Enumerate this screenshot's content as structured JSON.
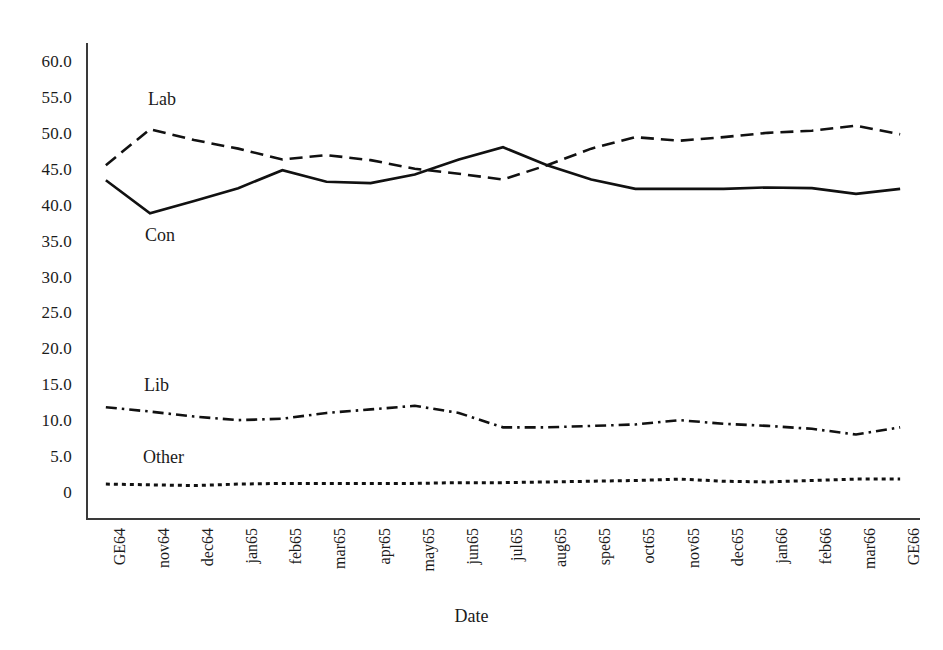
{
  "chart_data": {
    "type": "line",
    "title": "",
    "xlabel": "Date",
    "ylabel": "",
    "ylim": [
      0,
      60
    ],
    "grid": false,
    "legend_position": "in-plot labels",
    "categories": [
      "GE64",
      "nov64",
      "dec64",
      "jan65",
      "feb65",
      "mar65",
      "apr65",
      "may65",
      "jun65",
      "jul65",
      "aug65",
      "spe65",
      "oct65",
      "nov65",
      "dec65",
      "jan66",
      "feb66",
      "mar66",
      "GE66"
    ],
    "y_ticks": [
      "0",
      "5.0",
      "10.0",
      "15.0",
      "20.0",
      "25.0",
      "30.0",
      "35.0",
      "40.0",
      "45.0",
      "50.0",
      "55.0",
      "60.0"
    ],
    "y_tick_values": [
      0,
      5,
      10,
      15,
      20,
      25,
      30,
      35,
      40,
      45,
      50,
      55,
      60
    ],
    "series": [
      {
        "name": "Con",
        "style": "solid",
        "color": "#111111",
        "values": [
          43.4,
          38.8,
          40.5,
          42.3,
          44.8,
          43.2,
          43.0,
          44.2,
          46.3,
          48.0,
          45.5,
          43.5,
          42.2,
          42.2,
          42.2,
          42.4,
          42.3,
          41.5,
          42.2
        ]
      },
      {
        "name": "Lab",
        "style": "dashed",
        "color": "#111111",
        "values": [
          45.5,
          50.5,
          49.0,
          47.8,
          46.3,
          46.9,
          46.2,
          45.0,
          44.3,
          43.5,
          45.5,
          47.8,
          49.4,
          48.9,
          49.4,
          50.0,
          50.3,
          51.0,
          49.8
        ]
      },
      {
        "name": "Lib",
        "style": "dash-dot",
        "color": "#111111",
        "values": [
          11.8,
          11.2,
          10.5,
          10.0,
          10.2,
          11.0,
          11.5,
          12.0,
          11.0,
          9.0,
          9.0,
          9.2,
          9.4,
          10.0,
          9.5,
          9.2,
          8.8,
          8.0,
          9.0
        ]
      },
      {
        "name": "Other",
        "style": "dotted",
        "color": "#111111",
        "values": [
          1.1,
          1.0,
          0.9,
          1.1,
          1.2,
          1.2,
          1.2,
          1.2,
          1.3,
          1.3,
          1.4,
          1.5,
          1.6,
          1.8,
          1.5,
          1.4,
          1.6,
          1.8,
          1.8
        ]
      }
    ],
    "series_labels": {
      "lab": "Lab",
      "con": "Con",
      "lib": "Lib",
      "other": "Other"
    }
  },
  "axis": {
    "x_title": "Date"
  }
}
